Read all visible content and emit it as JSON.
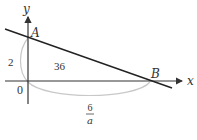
{
  "diagram": {
    "axes": {
      "x_label": "x",
      "y_label": "y",
      "origin_label": "0"
    },
    "points": {
      "A": "A",
      "B": "B"
    },
    "measurements": {
      "oa_length": "2",
      "ob_numerator": "6",
      "ob_denominator": "a",
      "area": "36"
    },
    "colors": {
      "axis": "#333333",
      "line": "#222222",
      "arc": "#c8c8c8"
    }
  }
}
